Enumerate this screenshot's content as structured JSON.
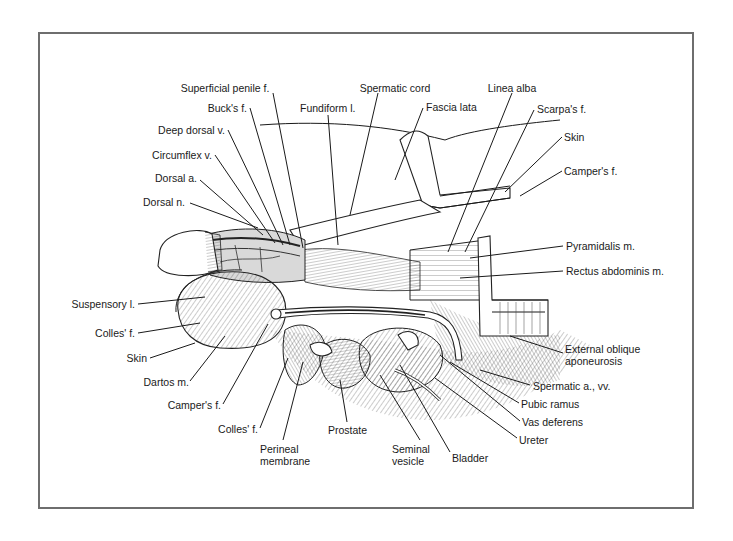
{
  "figure": {
    "colors": {
      "frame": "#6e6e6e",
      "ink": "#1a1a1a",
      "background": "#ffffff"
    }
  },
  "labels": {
    "top": [
      {
        "id": "superficial-penile-f",
        "text": "Superficial penile f."
      },
      {
        "id": "spermatic-cord",
        "text": "Spermatic cord"
      },
      {
        "id": "linea-alba",
        "text": "Linea alba"
      },
      {
        "id": "bucks-f",
        "text": "Buck's f."
      },
      {
        "id": "fundiform-l",
        "text": "Fundiform l."
      },
      {
        "id": "fascia-lata",
        "text": "Fascia lata"
      },
      {
        "id": "scarpas-f",
        "text": "Scarpa's f."
      }
    ],
    "left": [
      {
        "id": "deep-dorsal-v",
        "text": "Deep dorsal v."
      },
      {
        "id": "circumflex-v",
        "text": "Circumflex v."
      },
      {
        "id": "dorsal-a",
        "text": "Dorsal a."
      },
      {
        "id": "dorsal-n",
        "text": "Dorsal n."
      },
      {
        "id": "suspensory-l",
        "text": "Suspensory l."
      },
      {
        "id": "colles-f-left",
        "text": "Colles' f."
      },
      {
        "id": "skin-left",
        "text": "Skin"
      },
      {
        "id": "dartos-m",
        "text": "Dartos m."
      },
      {
        "id": "campers-f-left",
        "text": "Camper's f."
      },
      {
        "id": "colles-f-lower",
        "text": "Colles' f."
      }
    ],
    "right": [
      {
        "id": "skin-right",
        "text": "Skin"
      },
      {
        "id": "campers-f-right",
        "text": "Camper's f."
      },
      {
        "id": "pyramidalis-m",
        "text": "Pyramidalis m."
      },
      {
        "id": "rectus-abdominis-m",
        "text": "Rectus abdominis m."
      },
      {
        "id": "external-oblique-aponeurosis",
        "text": "External oblique",
        "text2": "aponeurosis"
      },
      {
        "id": "spermatic-a-vv",
        "text": "Spermatic a., vv."
      },
      {
        "id": "pubic-ramus",
        "text": "Pubic ramus"
      },
      {
        "id": "vas-deferens",
        "text": "Vas deferens"
      },
      {
        "id": "ureter",
        "text": "Ureter"
      }
    ],
    "bottom": [
      {
        "id": "perineal-membrane",
        "text": "Perineal",
        "text2": "membrane"
      },
      {
        "id": "prostate",
        "text": "Prostate"
      },
      {
        "id": "seminal-vesicle",
        "text": "Seminal",
        "text2": "vesicle"
      },
      {
        "id": "bladder",
        "text": "Bladder"
      }
    ]
  }
}
